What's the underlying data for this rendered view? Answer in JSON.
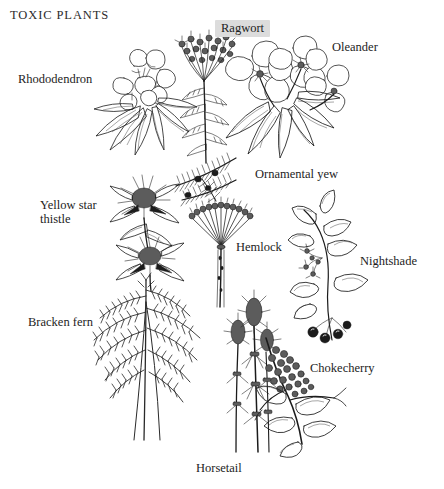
{
  "page": {
    "title": "TOXIC PLANTS",
    "background_color": "#ffffff",
    "ink_color": "#1b1b1b",
    "highlight_color": "#dcdcdc"
  },
  "labels": [
    {
      "id": "rhododendron",
      "text": "Rhododendron",
      "highlighted": false
    },
    {
      "id": "ragwort",
      "text": "Ragwort",
      "highlighted": true
    },
    {
      "id": "oleander",
      "text": "Oleander",
      "highlighted": false
    },
    {
      "id": "ornamental-yew",
      "text": "Ornamental yew",
      "highlighted": false
    },
    {
      "id": "yellow-star-thistle",
      "text": "Yellow star\nthistle",
      "highlighted": false
    },
    {
      "id": "hemlock",
      "text": "Hemlock",
      "highlighted": false
    },
    {
      "id": "nightshade",
      "text": "Nightshade",
      "highlighted": false
    },
    {
      "id": "bracken-fern",
      "text": "Bracken fern",
      "highlighted": false
    },
    {
      "id": "chokecherry",
      "text": "Chokecherry",
      "highlighted": false
    },
    {
      "id": "horsetail",
      "text": "Horsetail",
      "highlighted": false
    }
  ],
  "illustrations": [
    {
      "id": "rhododendron",
      "caption": "Rhododendron"
    },
    {
      "id": "ragwort",
      "caption": "Ragwort"
    },
    {
      "id": "oleander",
      "caption": "Oleander"
    },
    {
      "id": "ornamental-yew",
      "caption": "Ornamental yew"
    },
    {
      "id": "yellow-star-thistle",
      "caption": "Yellow star thistle"
    },
    {
      "id": "hemlock",
      "caption": "Hemlock"
    },
    {
      "id": "nightshade",
      "caption": "Nightshade"
    },
    {
      "id": "bracken-fern",
      "caption": "Bracken fern"
    },
    {
      "id": "horsetail",
      "caption": "Horsetail"
    },
    {
      "id": "chokecherry",
      "caption": "Chokecherry"
    }
  ]
}
